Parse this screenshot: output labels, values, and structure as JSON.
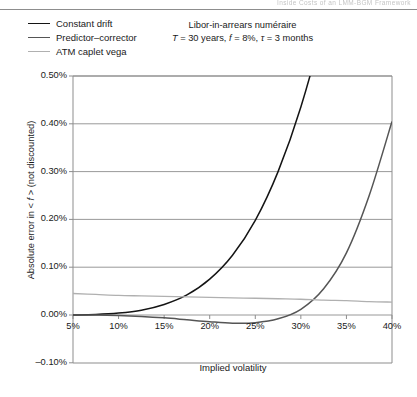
{
  "running_head": {
    "text": "Inside Costs of an LMM-BGM Framework"
  },
  "legend": {
    "items": [
      {
        "label": "Constant drift",
        "color": "#141414"
      },
      {
        "label": "Predictor–corrector",
        "color": "#555555"
      },
      {
        "label": "ATM caplet vega",
        "color": "#b0b0b0"
      }
    ]
  },
  "subtitle": {
    "line1": "Libor-in-arrears numéraire",
    "line2_pre": "T",
    "line2_a": " = 30 years, ",
    "line2_f": "f",
    "line2_b": " = 8%, ",
    "line2_tau": "τ",
    "line2_c": " = 3 months"
  },
  "axes": {
    "ylabel_pre": "Absolute error in < ",
    "ylabel_it": "f",
    "ylabel_post": " > (not discounted)",
    "xlabel": "Implied volatility",
    "yticks": [
      "0.50%",
      "0.40%",
      "0.30%",
      "0.20%",
      "0.10%",
      "0.00%",
      "–0.10%"
    ],
    "xticks": [
      "5%",
      "10%",
      "15%",
      "20%",
      "25%",
      "30%",
      "35%",
      "40%"
    ]
  },
  "chart_data": {
    "type": "line",
    "title": "Libor-in-arrears numéraire",
    "subtitle": "T = 30 years, f = 8%, τ = 3 months",
    "xlabel": "Implied volatility",
    "ylabel": "Absolute error in <f> (not discounted)",
    "xlim": [
      5,
      40
    ],
    "ylim": [
      -0.1,
      0.5
    ],
    "xticks": [
      5,
      10,
      15,
      20,
      25,
      30,
      35,
      40
    ],
    "yticks": [
      -0.1,
      0.0,
      0.1,
      0.2,
      0.3,
      0.4,
      0.5
    ],
    "grid": "horizontal",
    "legend_position": "top-left",
    "x": [
      5,
      7.5,
      10,
      12.5,
      15,
      17.5,
      20,
      22.5,
      25,
      27.5,
      30,
      32.5,
      35,
      37.5,
      40
    ],
    "series": [
      {
        "name": "Constant drift",
        "color": "#141414",
        "values": [
          0.0,
          0.001,
          0.004,
          0.01,
          0.022,
          0.042,
          0.075,
          0.125,
          0.198,
          0.3,
          0.435,
          0.61,
          0.83,
          1.1,
          1.42
        ],
        "note": "Rises steeply and exits the top of the plot area near 27% implied volatility"
      },
      {
        "name": "Predictor–corrector",
        "color": "#555555",
        "values": [
          0.0,
          0.0,
          -0.001,
          -0.003,
          -0.006,
          -0.01,
          -0.014,
          -0.017,
          -0.016,
          -0.008,
          0.012,
          0.055,
          0.13,
          0.25,
          0.405
        ]
      },
      {
        "name": "ATM caplet vega",
        "color": "#b0b0b0",
        "values": [
          0.045,
          0.043,
          0.041,
          0.04,
          0.039,
          0.038,
          0.037,
          0.036,
          0.035,
          0.034,
          0.033,
          0.031,
          0.03,
          0.028,
          0.027
        ]
      }
    ]
  }
}
